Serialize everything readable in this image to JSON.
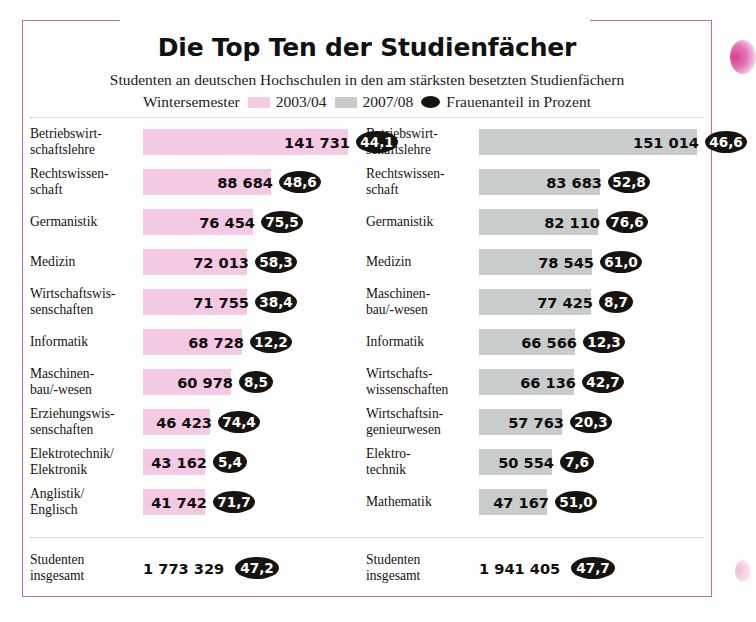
{
  "header": {
    "title": "Die Top Ten der Studienfächer",
    "subtitle": "Studenten an deutschen Hochschulen in den am stärksten besetzten Studienfächern",
    "legend_prefix": "Wintersemester",
    "legend_series_1": "2003/04",
    "legend_series_2": "2007/08",
    "legend_marker": "Frauenanteil in Prozent"
  },
  "colors": {
    "series_1": "#f3c9e4",
    "series_2": "#c9cccc",
    "marker": "#17140f",
    "frame": "#c96aa4",
    "rule": "#e3b6d3"
  },
  "totals": {
    "left": {
      "label": "Studenten\ninsgesamt",
      "value": "1 773 329",
      "pct": "47,2"
    },
    "right": {
      "label": "Studenten\ninsgesamt",
      "value": "1 941 405",
      "pct": "47,7"
    }
  },
  "chart_data": {
    "type": "bar",
    "title": "Die Top Ten der Studienfächer",
    "subtitle": "Studenten an deutschen Hochschulen in den am stärksten besetzten Studienfächern",
    "xlabel": "",
    "ylabel": "",
    "legend": [
      "2003/04",
      "2007/08",
      "Frauenanteil in Prozent"
    ],
    "legend_position": "top-center",
    "grid": false,
    "series": [
      {
        "name": "2003/04",
        "color": "#f3c9e4",
        "categories": [
          "Betriebswirt-\nschaftslehre",
          "Rechtswissen-\nschaft",
          "Germanistik",
          "Medizin",
          "Wirtschaftswis-\nsenschaften",
          "Informatik",
          "Maschinen-\nbau/-wesen",
          "Erziehungswis-\nsenschaften",
          "Elektrotechnik/\nElektronik",
          "Anglistik/\nEnglisch"
        ],
        "values": [
          141731,
          88684,
          76454,
          72013,
          71755,
          68728,
          60978,
          46423,
          43162,
          41742
        ],
        "value_labels": [
          "141 731",
          "88 684",
          "76 454",
          "72 013",
          "71 755",
          "68 728",
          "60 978",
          "46 423",
          "43 162",
          "41 742"
        ],
        "pct_women": [
          "44,1",
          "48,6",
          "75,5",
          "58,3",
          "38,4",
          "12,2",
          "8,5",
          "74,4",
          "5,4",
          "71,7"
        ],
        "total": 1773329,
        "total_label": "1 773 329",
        "total_pct": "47,2"
      },
      {
        "name": "2007/08",
        "color": "#c9cccc",
        "categories": [
          "Betriebswirt-\nschaftslehre",
          "Rechtswissen-\nschaft",
          "Germanistik",
          "Medizin",
          "Maschinen-\nbau/-wesen",
          "Informatik",
          "Wirtschafts-\nwissenschaften",
          "Wirtschaftsin-\ngenieurwesen",
          "Elektro-\ntechnik",
          "Mathematik"
        ],
        "values": [
          151014,
          83683,
          82110,
          78545,
          77425,
          66566,
          66136,
          57763,
          50554,
          47167
        ],
        "value_labels": [
          "151 014",
          "83 683",
          "82 110",
          "78 545",
          "77 425",
          "66 566",
          "66 136",
          "57 763",
          "50 554",
          "47 167"
        ],
        "pct_women": [
          "46,6",
          "52,8",
          "76,6",
          "61,0",
          "8,7",
          "12,3",
          "42,7",
          "20,3",
          "7,6",
          "51,0"
        ],
        "total": 1941405,
        "total_label": "1 941 405",
        "total_pct": "47,7"
      }
    ]
  }
}
